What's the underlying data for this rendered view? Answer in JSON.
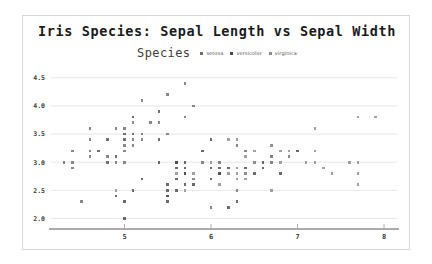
{
  "chart_data": {
    "type": "scatter",
    "title": "Iris Species: Sepal Length vs Sepal Width",
    "xlabel": "",
    "ylabel": "",
    "xlim": [
      4.15,
      8.15
    ],
    "ylim": [
      1.92,
      4.62
    ],
    "xticks": [
      5,
      6,
      7,
      8
    ],
    "xticklabels": [
      "5",
      "6",
      "7",
      "8"
    ],
    "yticks": [
      2.0,
      2.5,
      3.0,
      3.5,
      4.0,
      4.5
    ],
    "yticklabels": [
      "2.0",
      "2.5",
      "3.0",
      "3.5",
      "4.0",
      "4.5"
    ],
    "grid": "horizontal",
    "legend_position": "top-center",
    "legend_title": "Species",
    "marker": "square",
    "marker_size": 2.6,
    "series": [
      {
        "name": "setosa",
        "color": "#6e6e6e",
        "points": [
          [
            5.1,
            3.5
          ],
          [
            4.9,
            3.0
          ],
          [
            4.7,
            3.2
          ],
          [
            4.6,
            3.1
          ],
          [
            5.0,
            3.6
          ],
          [
            5.4,
            3.9
          ],
          [
            4.6,
            3.4
          ],
          [
            5.0,
            3.4
          ],
          [
            4.4,
            2.9
          ],
          [
            4.9,
            3.1
          ],
          [
            5.4,
            3.7
          ],
          [
            4.8,
            3.4
          ],
          [
            4.8,
            3.0
          ],
          [
            4.3,
            3.0
          ],
          [
            5.8,
            4.0
          ],
          [
            5.7,
            4.4
          ],
          [
            5.4,
            3.9
          ],
          [
            5.1,
            3.5
          ],
          [
            5.7,
            3.8
          ],
          [
            5.1,
            3.8
          ],
          [
            5.4,
            3.4
          ],
          [
            5.1,
            3.7
          ],
          [
            4.6,
            3.6
          ],
          [
            5.1,
            3.3
          ],
          [
            4.8,
            3.4
          ],
          [
            5.0,
            3.0
          ],
          [
            5.0,
            3.4
          ],
          [
            5.2,
            3.5
          ],
          [
            5.2,
            3.4
          ],
          [
            4.7,
            3.2
          ],
          [
            4.8,
            3.1
          ],
          [
            5.4,
            3.4
          ],
          [
            5.2,
            4.1
          ],
          [
            5.5,
            4.2
          ],
          [
            4.9,
            3.1
          ],
          [
            5.0,
            3.2
          ],
          [
            5.5,
            3.5
          ],
          [
            4.9,
            3.6
          ],
          [
            4.4,
            3.0
          ],
          [
            5.1,
            3.4
          ],
          [
            5.0,
            3.5
          ],
          [
            4.5,
            2.3
          ],
          [
            4.4,
            3.2
          ],
          [
            5.0,
            3.5
          ],
          [
            5.1,
            3.8
          ],
          [
            4.8,
            3.0
          ],
          [
            5.1,
            3.8
          ],
          [
            4.6,
            3.2
          ],
          [
            5.3,
            3.7
          ],
          [
            5.0,
            3.3
          ]
        ]
      },
      {
        "name": "versicolor",
        "color": "#4a4a4a",
        "points": [
          [
            7.0,
            3.2
          ],
          [
            6.4,
            3.2
          ],
          [
            6.9,
            3.1
          ],
          [
            5.5,
            2.3
          ],
          [
            6.5,
            2.8
          ],
          [
            5.7,
            2.8
          ],
          [
            6.3,
            3.3
          ],
          [
            4.9,
            2.4
          ],
          [
            6.6,
            2.9
          ],
          [
            5.2,
            2.7
          ],
          [
            5.0,
            2.0
          ],
          [
            5.9,
            3.0
          ],
          [
            6.0,
            2.2
          ],
          [
            6.1,
            2.9
          ],
          [
            5.6,
            2.9
          ],
          [
            6.7,
            3.1
          ],
          [
            5.6,
            3.0
          ],
          [
            5.8,
            2.7
          ],
          [
            6.2,
            2.2
          ],
          [
            5.6,
            2.5
          ],
          [
            5.9,
            3.2
          ],
          [
            6.1,
            2.8
          ],
          [
            6.3,
            2.5
          ],
          [
            6.1,
            2.8
          ],
          [
            6.4,
            2.9
          ],
          [
            6.6,
            3.0
          ],
          [
            6.8,
            2.8
          ],
          [
            6.7,
            3.0
          ],
          [
            6.0,
            2.9
          ],
          [
            5.7,
            2.6
          ],
          [
            5.5,
            2.4
          ],
          [
            5.5,
            2.4
          ],
          [
            5.8,
            2.7
          ],
          [
            6.0,
            2.7
          ],
          [
            5.4,
            3.0
          ],
          [
            6.0,
            3.4
          ],
          [
            6.7,
            3.1
          ],
          [
            6.3,
            2.3
          ],
          [
            5.6,
            3.0
          ],
          [
            5.5,
            2.5
          ],
          [
            5.5,
            2.6
          ],
          [
            6.1,
            3.0
          ],
          [
            5.8,
            2.6
          ],
          [
            5.0,
            2.3
          ],
          [
            5.6,
            2.7
          ],
          [
            5.7,
            3.0
          ],
          [
            5.7,
            2.9
          ],
          [
            6.2,
            2.9
          ],
          [
            5.1,
            2.5
          ],
          [
            5.7,
            2.8
          ]
        ]
      },
      {
        "name": "virginica",
        "color": "#8c8c8c",
        "points": [
          [
            6.3,
            3.3
          ],
          [
            5.8,
            2.7
          ],
          [
            7.1,
            3.0
          ],
          [
            6.3,
            2.9
          ],
          [
            6.5,
            3.0
          ],
          [
            7.6,
            3.0
          ],
          [
            4.9,
            2.5
          ],
          [
            7.3,
            2.9
          ],
          [
            6.7,
            2.5
          ],
          [
            7.2,
            3.6
          ],
          [
            6.5,
            3.2
          ],
          [
            6.4,
            2.7
          ],
          [
            6.8,
            3.0
          ],
          [
            5.7,
            2.5
          ],
          [
            5.8,
            2.8
          ],
          [
            6.4,
            3.2
          ],
          [
            6.5,
            3.0
          ],
          [
            7.7,
            3.8
          ],
          [
            7.7,
            2.6
          ],
          [
            6.0,
            2.2
          ],
          [
            6.9,
            3.2
          ],
          [
            5.6,
            2.8
          ],
          [
            7.7,
            2.8
          ],
          [
            6.3,
            2.7
          ],
          [
            6.7,
            3.3
          ],
          [
            7.2,
            3.2
          ],
          [
            6.2,
            2.8
          ],
          [
            6.1,
            3.0
          ],
          [
            6.4,
            2.8
          ],
          [
            7.2,
            3.0
          ],
          [
            7.4,
            2.8
          ],
          [
            7.9,
            3.8
          ],
          [
            6.4,
            2.8
          ],
          [
            6.3,
            2.8
          ],
          [
            6.1,
            2.6
          ],
          [
            7.7,
            3.0
          ],
          [
            6.3,
            3.4
          ],
          [
            6.4,
            3.1
          ],
          [
            6.0,
            3.0
          ],
          [
            6.9,
            3.1
          ],
          [
            6.7,
            3.1
          ],
          [
            6.9,
            3.1
          ],
          [
            5.8,
            2.7
          ],
          [
            6.8,
            3.2
          ],
          [
            6.7,
            3.3
          ],
          [
            6.7,
            3.0
          ],
          [
            6.3,
            2.5
          ],
          [
            6.5,
            3.0
          ],
          [
            6.2,
            3.4
          ],
          [
            5.9,
            3.0
          ]
        ]
      }
    ]
  }
}
